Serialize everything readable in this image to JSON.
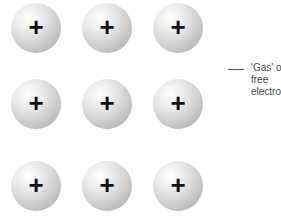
{
  "diagram": {
    "ions": [
      {
        "row": 0,
        "col": 0,
        "symbol": "+"
      },
      {
        "row": 0,
        "col": 1,
        "symbol": "+"
      },
      {
        "row": 0,
        "col": 2,
        "symbol": "+"
      },
      {
        "row": 1,
        "col": 0,
        "symbol": "+"
      },
      {
        "row": 1,
        "col": 1,
        "symbol": "+"
      },
      {
        "row": 1,
        "col": 2,
        "symbol": "+"
      },
      {
        "row": 2,
        "col": 0,
        "symbol": "+"
      },
      {
        "row": 2,
        "col": 1,
        "symbol": "+"
      },
      {
        "row": 2,
        "col": 2,
        "symbol": "+"
      }
    ],
    "label_lines": [
      "'Gas' of",
      "free",
      "electrons"
    ]
  }
}
